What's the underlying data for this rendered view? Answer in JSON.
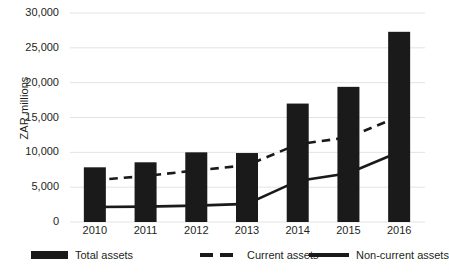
{
  "chart_data": {
    "type": "bar",
    "title": "",
    "subtitle": "",
    "xlabel": "",
    "ylabel": "ZAR millions",
    "categories": [
      "2010",
      "2011",
      "2012",
      "2013",
      "2014",
      "2015",
      "2016"
    ],
    "ylim": [
      0,
      30000
    ],
    "yticks": [
      0,
      5000,
      10000,
      15000,
      20000,
      25000,
      30000
    ],
    "ytick_labels": [
      "0",
      "5,000",
      "10,000",
      "15,000",
      "20,000",
      "25,000",
      "30,000"
    ],
    "grid": true,
    "grid_axis": "y",
    "legend_position": "bottom",
    "series": [
      {
        "name": "Total assets",
        "type": "bar",
        "color": "#1a1a1a",
        "values": [
          7850,
          8570,
          10000,
          9900,
          17000,
          19400,
          27300
        ]
      },
      {
        "name": "Current assets",
        "type": "line",
        "style": "dashed",
        "color": "#1a1a1a",
        "values": [
          6000,
          6600,
          7400,
          8150,
          11150,
          12150,
          15150
        ]
      },
      {
        "name": "Non-current assets",
        "type": "line",
        "style": "solid",
        "color": "#1a1a1a",
        "values": [
          2150,
          2200,
          2350,
          2600,
          5900,
          7000,
          10050
        ]
      }
    ]
  },
  "axis": {
    "y_title": "ZAR millions"
  },
  "legend": {
    "items": [
      {
        "label": "Total assets",
        "marker": "bar-swatch-icon"
      },
      {
        "label": "Current assets",
        "marker": "dashed-line-icon"
      },
      {
        "label": "Non-current assets",
        "marker": "solid-line-icon"
      }
    ]
  }
}
